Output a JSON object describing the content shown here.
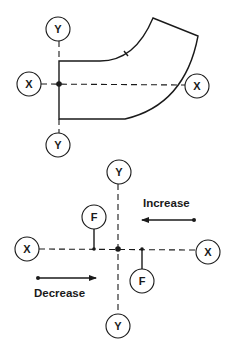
{
  "colors": {
    "ink": "#1a1a1a",
    "background": "#ffffff"
  },
  "upper_diagram": {
    "description": "Pipe elbow with X and Y reference axes through the flange face",
    "axis_labels": {
      "y_top": "Y",
      "y_bottom": "Y",
      "x_left": "X",
      "x_right": "X"
    }
  },
  "lower_diagram": {
    "description": "Axis cross with F markers and direction arrows",
    "axis_labels": {
      "y_top": "Y",
      "y_bottom": "Y",
      "x_left": "X",
      "x_right": "X"
    },
    "markers": {
      "f_upper_left": "F",
      "f_lower_right": "F"
    },
    "arrows": {
      "increase_label": "Increase",
      "increase_direction": "left",
      "decrease_label": "Decrease",
      "decrease_direction": "right"
    }
  }
}
